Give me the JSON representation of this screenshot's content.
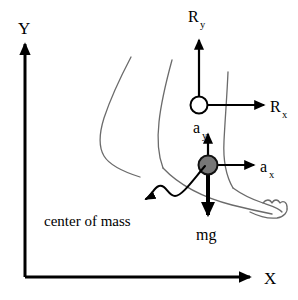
{
  "figure": {
    "background_color": "#ffffff",
    "width": 298,
    "height": 300,
    "outline_color": "#6b6b6b",
    "vector_color": "#000000",
    "com_fill_color": "#777777"
  },
  "axes": {
    "y_label": "Y",
    "x_label": "X",
    "origin": {
      "x": 25,
      "y": 277
    },
    "y_tip": {
      "x": 25,
      "y": 42
    },
    "x_tip": {
      "x": 252,
      "y": 277
    }
  },
  "vectors": [
    {
      "id": "reaction-vertical",
      "label": "R",
      "subscript": "y",
      "direction": "up",
      "origin": {
        "x": 199,
        "y": 105
      },
      "tip": {
        "x": 199,
        "y": 38
      },
      "label_position": {
        "x": 190,
        "y": 22
      }
    },
    {
      "id": "reaction-horizontal",
      "label": "R",
      "subscript": "x",
      "direction": "right",
      "origin": {
        "x": 199,
        "y": 105
      },
      "tip": {
        "x": 266,
        "y": 105
      },
      "label_position": {
        "x": 270,
        "y": 111
      }
    },
    {
      "id": "acceleration-vertical",
      "label": "a",
      "subscript": "y",
      "direction": "up",
      "origin": {
        "x": 208,
        "y": 165
      },
      "tip": {
        "x": 208,
        "y": 132
      },
      "label_position": {
        "x": 196,
        "y": 131
      }
    },
    {
      "id": "acceleration-horizontal",
      "label": "a",
      "subscript": "x",
      "direction": "right",
      "origin": {
        "x": 208,
        "y": 165
      },
      "tip": {
        "x": 256,
        "y": 165
      },
      "label_position": {
        "x": 261,
        "y": 171
      }
    },
    {
      "id": "weight",
      "label": "mg",
      "subscript": "",
      "direction": "down",
      "origin": {
        "x": 208,
        "y": 165
      },
      "tip": {
        "x": 208,
        "y": 218
      },
      "label_position": {
        "x": 199,
        "y": 238
      }
    }
  ],
  "markers": {
    "ankle_joint": {
      "name": "ankle joint",
      "x": 199,
      "y": 105,
      "r": 8.5,
      "fill": "#ffffff"
    },
    "center_of_mass": {
      "name": "center of mass",
      "x": 208,
      "y": 165,
      "r": 9.5,
      "fill": "#777777"
    }
  },
  "annotations": [
    {
      "id": "center-of-mass",
      "text": "center of mass",
      "text_position": {
        "x": 46,
        "y": 223
      },
      "arrow_tip": {
        "x": 152,
        "y": 202
      }
    }
  ]
}
